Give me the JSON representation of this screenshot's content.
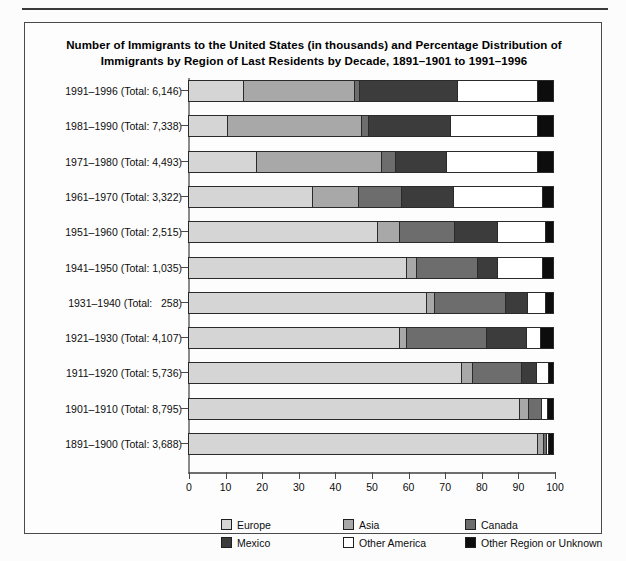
{
  "chart_data": {
    "type": "bar",
    "orientation": "horizontal",
    "stacked": true,
    "title": "Number of Immigrants to the United States (in thousands) and Percentage Distribution of Immigrants by Region of Last Residents by Decade, 1891–1901 to 1991–1996",
    "title_line1": "Number of Immigrants to the United States (in thousands) and Percentage Distribution of",
    "title_line2": "Immigrants by Region of Last Residents by Decade, 1891–1901 to 1991–1996",
    "xlabel": "",
    "ylabel": "",
    "xlim": [
      0,
      100
    ],
    "xticks": [
      0,
      10,
      20,
      30,
      40,
      50,
      60,
      70,
      80,
      90,
      100
    ],
    "grid": false,
    "legend_position": "bottom",
    "categories": [
      "1991–1996 (Total: 6,146)",
      "1981–1990 (Total: 7,338)",
      "1971–1980 (Total: 4,493)",
      "1961–1970 (Total: 3,322)",
      "1951–1960 (Total: 2,515)",
      "1941–1950 (Total: 1,035)",
      "1931–1940 (Total:   258)",
      "1921–1930 (Total: 4,107)",
      "1911–1920 (Total: 5,736)",
      "1901–1910 (Total: 8,795)",
      "1891–1900 (Total: 3,688)"
    ],
    "decades": [
      "1991–1996",
      "1981–1990",
      "1971–1980",
      "1961–1970",
      "1951–1960",
      "1941–1950",
      "1931–1940",
      "1921–1930",
      "1911–1920",
      "1901–1910",
      "1891–1900"
    ],
    "totals": [
      6146,
      7338,
      4493,
      3322,
      2515,
      1035,
      258,
      4107,
      5736,
      8795,
      3688
    ],
    "series": [
      {
        "name": "Europe",
        "color": "#d5d5d5",
        "values": [
          15.0,
          10.6,
          18.6,
          34.0,
          52.0,
          60.0,
          65.3,
          58.0,
          75.0,
          91.0,
          96.0
        ]
      },
      {
        "name": "Asia",
        "color": "#a8a8a8",
        "values": [
          30.6,
          36.9,
          34.4,
          12.7,
          6.0,
          2.6,
          2.4,
          2.0,
          3.0,
          2.5,
          1.6
        ]
      },
      {
        "name": "Canada",
        "color": "#6d6d6d",
        "values": [
          1.4,
          1.9,
          4.0,
          11.8,
          15.0,
          16.9,
          19.3,
          22.0,
          13.5,
          3.5,
          0.8
        ]
      },
      {
        "name": "Mexico",
        "color": "#3c3c3c",
        "values": [
          27.0,
          22.6,
          14.0,
          14.2,
          12.0,
          5.5,
          6.0,
          11.0,
          4.0,
          0.0,
          0.0
        ]
      },
      {
        "name": "Other America",
        "color": "#ffffff",
        "values": [
          22.0,
          24.0,
          25.0,
          24.6,
          13.0,
          12.3,
          5.0,
          3.7,
          3.5,
          1.7,
          0.6
        ]
      },
      {
        "name": "Other Region or Unknown",
        "color": "#0d0d0d",
        "values": [
          4.0,
          4.0,
          4.0,
          2.7,
          2.0,
          2.7,
          2.0,
          3.3,
          1.0,
          1.3,
          1.0
        ]
      }
    ],
    "legend": [
      {
        "label": "Europe",
        "color": "#d5d5d5"
      },
      {
        "label": "Asia",
        "color": "#a8a8a8"
      },
      {
        "label": "Canada",
        "color": "#6d6d6d"
      },
      {
        "label": "Mexico",
        "color": "#3c3c3c"
      },
      {
        "label": "Other America",
        "color": "#ffffff"
      },
      {
        "label": "Other Region or Unknown",
        "color": "#0d0d0d"
      }
    ]
  }
}
